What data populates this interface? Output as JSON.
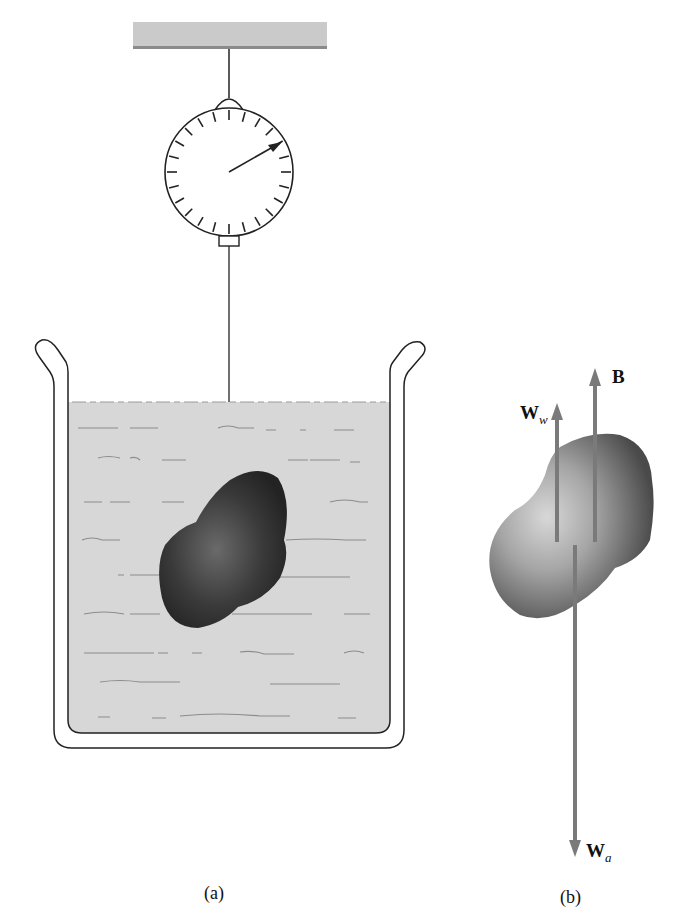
{
  "figure": {
    "panel_a": {
      "caption": "(a)",
      "description": "Object suspended from a spring scale, fully submerged in a beaker of water"
    },
    "panel_b": {
      "caption": "(b)",
      "description": "Free-body diagram of the submerged object",
      "forces": [
        {
          "symbol": "B",
          "subscript": "",
          "direction": "up"
        },
        {
          "symbol": "W",
          "subscript": "w",
          "direction": "up"
        },
        {
          "symbol": "W",
          "subscript": "a",
          "direction": "down"
        }
      ]
    },
    "colors": {
      "water": "#d6d6d6",
      "ceiling": "#c8c8c8",
      "arrow": "#7a7a7a",
      "object_dark": "#2e2e2e",
      "object_light": "#9a9a9a"
    }
  }
}
